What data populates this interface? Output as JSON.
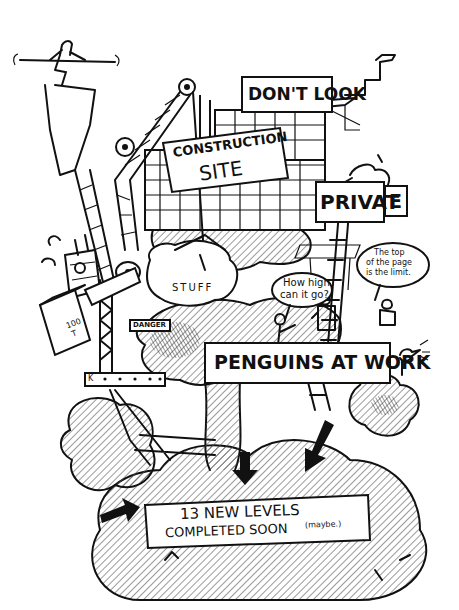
{
  "illustration": {
    "title": "Penguins at work construction site",
    "style": "hand-drawn ink cartoon",
    "colors": {
      "ink": "#111111",
      "paper": "#ffffff",
      "hatch": "#555555"
    }
  },
  "signs": {
    "dont_look": "DON'T LOOK",
    "construction_line1": "CONSTRUCTION",
    "construction_line2": "SITE",
    "private_main": "PRIVAT",
    "private_tail": "E",
    "danger": "DANGER",
    "penguins_at_work": "PENGUINS AT WORK",
    "new_levels_line1": "13 NEW LEVELS",
    "new_levels_line2": "COMPLETED SOON",
    "new_levels_note": "(maybe.)"
  },
  "speech": {
    "how_high_line1": "How high",
    "how_high_line2": "can it go?",
    "top_line1": "The top",
    "top_line2": "of the page",
    "top_line3": "is the limit."
  },
  "objects": {
    "stuff_bag": "STUFF",
    "crate_weight_1": "100",
    "crate_weight_2": "T",
    "beam_tag": "K"
  }
}
